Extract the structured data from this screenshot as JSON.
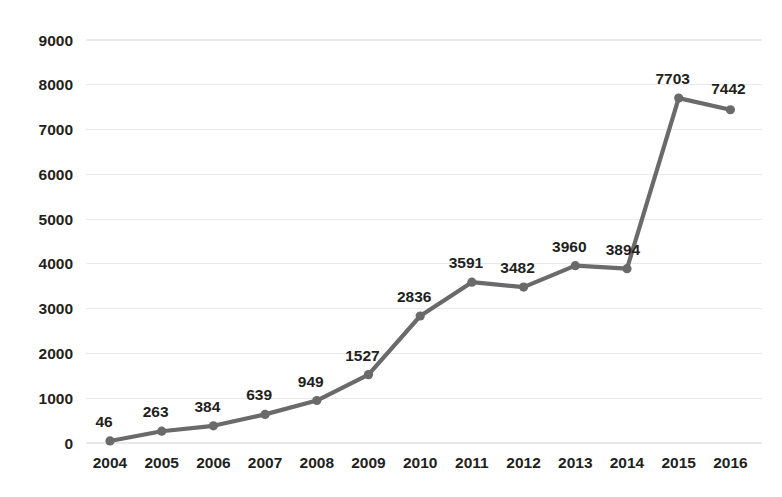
{
  "chart_data": {
    "type": "line",
    "title": "",
    "subtitle": "",
    "xlabel": "",
    "ylabel": "",
    "categories": [
      "2004",
      "2005",
      "2006",
      "2007",
      "2008",
      "2009",
      "2010",
      "2011",
      "2012",
      "2013",
      "2014",
      "2015",
      "2016"
    ],
    "values": [
      46,
      263,
      384,
      639,
      949,
      1527,
      2836,
      3591,
      3482,
      3960,
      3894,
      7703,
      7442
    ],
    "series": [
      {
        "name": "",
        "values": [
          46,
          263,
          384,
          639,
          949,
          1527,
          2836,
          3591,
          3482,
          3960,
          3894,
          7703,
          7442
        ]
      }
    ],
    "data_labels": [
      "46",
      "263",
      "384",
      "639",
      "949",
      "1527",
      "2836",
      "3591",
      "3482",
      "3960",
      "3894",
      "7703",
      "7442"
    ],
    "data_labels_shown": true,
    "ylim": [
      0,
      9000
    ],
    "ytick_values": [
      0,
      1000,
      2000,
      3000,
      4000,
      5000,
      6000,
      7000,
      8000,
      9000
    ],
    "ytick_labels": [
      "0",
      "1000",
      "2000",
      "3000",
      "4000",
      "5000",
      "6000",
      "7000",
      "8000",
      "9000"
    ],
    "xtick_labels": [
      "2004",
      "2005",
      "2006",
      "2007",
      "2008",
      "2009",
      "2010",
      "2011",
      "2012",
      "2013",
      "2014",
      "2015",
      "2016"
    ],
    "grid": {
      "horizontal": true,
      "vertical": false,
      "color": "#e9e9e9"
    },
    "legend": {
      "shown": false,
      "position": "none",
      "entries": []
    },
    "colors": {
      "line": "#6a6a6a",
      "marker": "#6a6a6a",
      "text": "#231f20",
      "gridline": "#e9e9e9",
      "background": "#ffffff"
    },
    "marker": {
      "shape": "circle",
      "radius": 4.6
    },
    "annotations": []
  }
}
